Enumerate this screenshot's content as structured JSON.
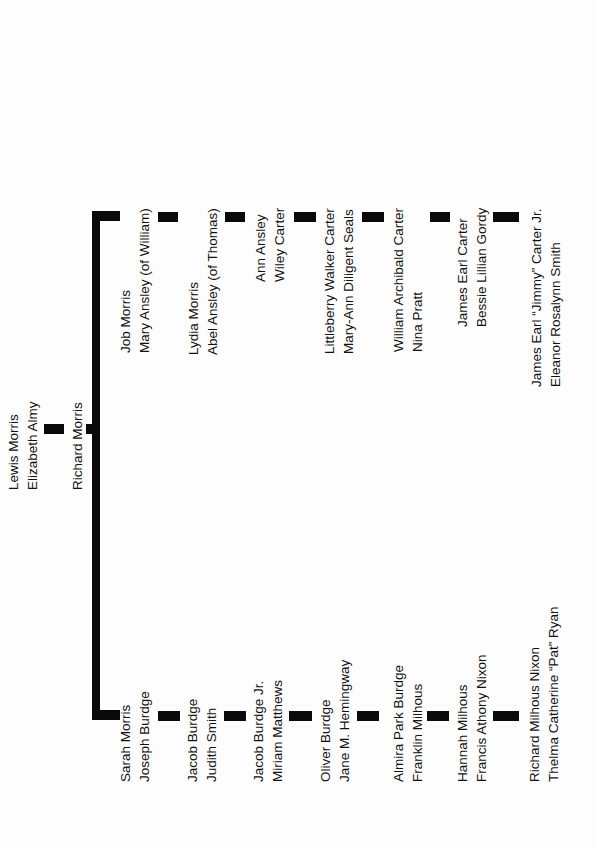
{
  "diagram": {
    "type": "family-tree",
    "orientation": "rotated-90-ccw",
    "root": {
      "couple": [
        "Lewis Morris",
        "Elizabeth Almy"
      ],
      "child": "Richard Morris"
    },
    "branch_carter": [
      {
        "line1": "Job Morris",
        "line2": "Mary Ansley (of William)"
      },
      {
        "line1": "Lydia Morris",
        "line2": "Abel Ansley (of Thomas)"
      },
      {
        "line1": "Ann Ansley",
        "line2": "Wiley Carter"
      },
      {
        "line1": "Littleberry Walker Carter",
        "line2": "Mary-Ann Diligent Seals"
      },
      {
        "line1": "William Archibald Carter",
        "line2": "Nina Pratt"
      },
      {
        "line1": "James Earl Carter",
        "line2": "Bessie Lillian Gordy"
      },
      {
        "line1": "James Earl “Jimmy” Carter Jr.",
        "line2": "Eleanor Rosalynn Smith"
      }
    ],
    "branch_nixon": [
      {
        "line1": "Sarah Morris",
        "line2": "Joseph Burdge"
      },
      {
        "line1": "Jacob Burdge",
        "line2": "Judith Smith"
      },
      {
        "line1": "Jacob Burdge Jr.",
        "line2": "Miriam Matthews"
      },
      {
        "line1": "Oliver Burdge",
        "line2": "Jane M. Hemingway"
      },
      {
        "line1": "Almira Park Burdge",
        "line2": "Franklin Milhous"
      },
      {
        "line1": "Hannah Milhous",
        "line2": "Francis Athony Nixon"
      },
      {
        "line1": "Richard Milhous Nixon",
        "line2": "Thelma Catherine “Pat” Ryan"
      }
    ],
    "colors": {
      "line": "#0a0a0a",
      "text": "#111111",
      "background": "#fdfdfd"
    }
  }
}
